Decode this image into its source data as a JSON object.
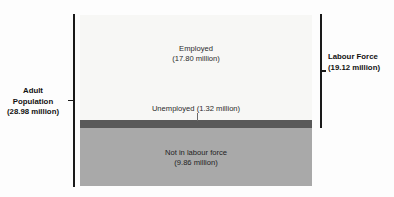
{
  "chart_data": {
    "type": "bar",
    "title": "",
    "subtitle": "",
    "xlabel": "",
    "ylabel": "",
    "orientation": "stacked-vertical",
    "units": "million people",
    "grid": false,
    "legend_position": "none",
    "categories": [
      "Employed",
      "Unemployed",
      "Not in labour force"
    ],
    "values": [
      17.8,
      1.32,
      9.86
    ],
    "series": [
      {
        "name": "Population breakdown",
        "values": [
          17.8,
          1.32,
          9.86
        ]
      }
    ],
    "segments": [
      {
        "name": "Employed",
        "label": "Employed",
        "value_label": "(17.80 million)",
        "value": 17.8,
        "color": "#f7f7f5"
      },
      {
        "name": "Unemployed",
        "label": "Unemployed (1.32 million)",
        "value_label": "(1.32 million)",
        "value": 1.32,
        "color": "#595959"
      },
      {
        "name": "Not in labour force",
        "label": "Not in labour force",
        "value_label": "(9.86 million)",
        "value": 9.86,
        "color": "#a9a9a9"
      }
    ],
    "annotations": [
      {
        "name": "Adult Population",
        "label": "Adult Population",
        "value_label": "(28.98 million)",
        "value": 28.98,
        "covers": [
          "Employed",
          "Unemployed",
          "Not in labour force"
        ],
        "side": "left"
      },
      {
        "name": "Labour Force",
        "label": "Labour Force",
        "value_label": "(19.12 million)",
        "value": 19.12,
        "covers": [
          "Employed",
          "Unemployed"
        ],
        "side": "right"
      }
    ]
  },
  "bands": {
    "employed": {
      "label": "Employed",
      "value": "(17.80 million)"
    },
    "unemployed": {
      "label": "Unemployed (1.32 million)"
    },
    "not_in_labour_force": {
      "label": "Not in labour force",
      "value": "(9.86 million)"
    }
  },
  "brackets": {
    "adult_population": {
      "line1": "Adult",
      "line2": "Population",
      "line3": "(28.98 million)"
    },
    "labour_force": {
      "line1": "Labour Force",
      "line2": "(19.12 million)"
    }
  },
  "colors": {
    "employed": "#f7f7f5",
    "unemployed": "#595959",
    "not_in_labour_force": "#a9a9a9",
    "bracket": "#1a1a1a",
    "text": "#111111"
  }
}
